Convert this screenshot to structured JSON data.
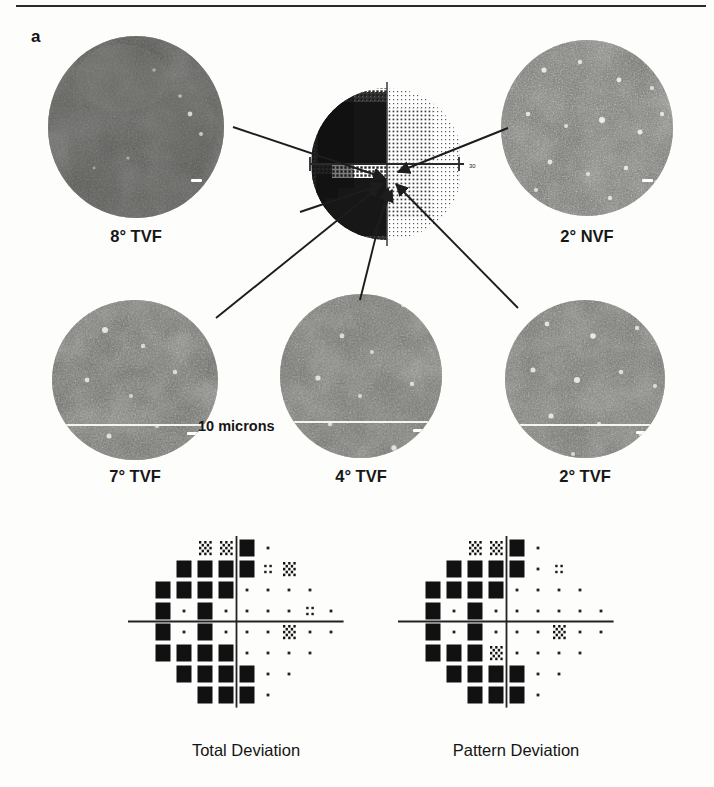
{
  "figure": {
    "panel_letter": "a",
    "scale_bar_text": "10 microns"
  },
  "micrographs": [
    {
      "id": "tvf8",
      "label": "8° TVF",
      "brightness": "dark",
      "speckle": "low"
    },
    {
      "id": "nvf2",
      "label": "2° NVF",
      "brightness": "bright",
      "speckle": "high"
    },
    {
      "id": "tvf7",
      "label": "7° TVF",
      "brightness": "medium",
      "speckle": "medium"
    },
    {
      "id": "tvf4",
      "label": "4° TVF",
      "brightness": "medium",
      "speckle": "medium"
    },
    {
      "id": "tvf2",
      "label": "2° TVF",
      "brightness": "bright",
      "speckle": "high"
    }
  ],
  "visual_field": {
    "name": "grayscale-visual-field-plot",
    "axis_label_right": "30",
    "description": "Humphrey grayscale visual field with dense defect in the nasal/left hemifield"
  },
  "deviation_plots": [
    {
      "id": "total",
      "label": "Total Deviation"
    },
    {
      "id": "pattern",
      "label": "Pattern Deviation"
    }
  ],
  "chart_data": {
    "type": "heatmap",
    "symbol_legend": {
      "black": "p < 0.5%",
      "hatch": "p < 1%",
      "quad": "p < 2%",
      "dot": "within normal limits"
    },
    "grid": {
      "cols": 10,
      "rows": 8,
      "spacing": 21
    },
    "total_deviation": {
      "title": "Total Deviation",
      "rows": [
        [
          null,
          null,
          null,
          "hatch",
          "hatch",
          "black",
          "dot",
          null,
          null,
          null
        ],
        [
          null,
          null,
          "black",
          "black",
          "black",
          "black",
          "quad",
          "hatch",
          null,
          null
        ],
        [
          null,
          "black",
          "black",
          "black",
          "black",
          "dot",
          "dot",
          "dot",
          "dot",
          null
        ],
        [
          null,
          "black",
          "dot",
          "black",
          "dot",
          "dot",
          "dot",
          "dot",
          "quad",
          "dot"
        ],
        [
          null,
          "black",
          "dot",
          "black",
          "dot",
          "dot",
          "dot",
          "hatch",
          "dot",
          "dot"
        ],
        [
          null,
          "black",
          "black",
          "black",
          "black",
          "dot",
          "dot",
          "dot",
          "dot",
          null
        ],
        [
          null,
          null,
          "black",
          "black",
          "black",
          "black",
          "dot",
          "dot",
          null,
          null
        ],
        [
          null,
          null,
          null,
          "black",
          "black",
          "black",
          "dot",
          null,
          null,
          null
        ]
      ]
    },
    "pattern_deviation": {
      "title": "Pattern Deviation",
      "rows": [
        [
          null,
          null,
          null,
          "hatch",
          "hatch",
          "black",
          "dot",
          null,
          null,
          null
        ],
        [
          null,
          null,
          "black",
          "black",
          "black",
          "black",
          "dot",
          "quad",
          null,
          null
        ],
        [
          null,
          "black",
          "black",
          "black",
          "black",
          "dot",
          "dot",
          "dot",
          "dot",
          null
        ],
        [
          null,
          "black",
          "dot",
          "black",
          "dot",
          "dot",
          "dot",
          "dot",
          "dot",
          "dot"
        ],
        [
          null,
          "black",
          "dot",
          "black",
          "dot",
          "dot",
          "dot",
          "hatch",
          "dot",
          "dot"
        ],
        [
          null,
          "black",
          "black",
          "black",
          "hatch",
          "dot",
          "dot",
          "dot",
          "dot",
          null
        ],
        [
          null,
          null,
          "black",
          "black",
          "black",
          "black",
          "dot",
          "dot",
          null,
          null
        ],
        [
          null,
          null,
          null,
          "black",
          "black",
          "black",
          "dot",
          null,
          null,
          null
        ]
      ]
    }
  },
  "arrows": [
    {
      "from": "vf-upper-left",
      "to": "tvf8",
      "name": "arrow-to-8-tvf"
    },
    {
      "from": "vf-upper-right",
      "to": "nvf2",
      "name": "arrow-to-2-nvf"
    },
    {
      "from": "vf-lower-left",
      "to": "tvf7",
      "name": "arrow-to-7-tvf"
    },
    {
      "from": "vf-lower",
      "to": "tvf4",
      "name": "arrow-to-4-tvf"
    },
    {
      "from": "vf-lower-right",
      "to": "tvf2",
      "name": "arrow-to-2-tvf"
    }
  ]
}
